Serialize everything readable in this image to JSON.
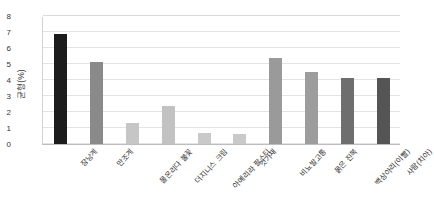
{
  "chart_data": {
    "type": "bar",
    "title": "",
    "subtitle": "",
    "xlabel": "",
    "ylabel": "균형(%)",
    "ylim": [
      0,
      8
    ],
    "ytick_labels": [
      "0",
      "1",
      "2",
      "3",
      "4",
      "5",
      "6",
      "7",
      "8"
    ],
    "ytick_values": [
      0,
      1,
      2,
      3,
      4,
      5,
      6,
      7,
      8
    ],
    "grid": true,
    "legend": "none",
    "categories": [
      "장낭계",
      "만조계",
      "물온리다 불꽃",
      "더지니스 크림",
      "아예리라 팔스티",
      "것가재",
      "비뇨발고통",
      "묽은 진복",
      "백상아리(이빨)",
      "사람(치아)"
    ],
    "values": [
      6.9,
      5.15,
      1.3,
      2.4,
      0.7,
      0.6,
      5.4,
      4.5,
      4.15,
      4.15
    ],
    "bar_colors": [
      "#1c1c1c",
      "#8a8a8a",
      "#c6c6c6",
      "#c2c2c2",
      "#c9c9c9",
      "#c9c9c9",
      "#9a9a9a",
      "#9d9d9d",
      "#6e6e6e",
      "#555555"
    ]
  }
}
